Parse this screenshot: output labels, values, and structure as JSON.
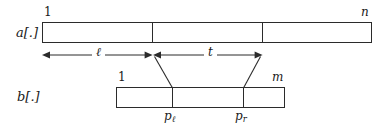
{
  "figure": {
    "caption_type": "string-matching-array-diagram",
    "arrays": [
      {
        "id": "a",
        "name_label": "a[.]",
        "start_label": "1",
        "end_label": "n",
        "segments": 3
      },
      {
        "id": "b",
        "name_label": "b[.]",
        "start_label": "1",
        "end_label": "m",
        "segments": 3
      }
    ],
    "measures": [
      {
        "id": "l",
        "label": "ℓ",
        "kind": "double-arrow"
      },
      {
        "id": "t",
        "label": "t",
        "kind": "double-arrow"
      }
    ],
    "positions": [
      {
        "id": "p_l",
        "base": "p",
        "subscript": "ℓ"
      },
      {
        "id": "p_r",
        "base": "p",
        "subscript": "r"
      }
    ],
    "colors": {
      "stroke": "#2b2b2b",
      "text": "#1a1a1a",
      "background": "#ffffff"
    }
  }
}
